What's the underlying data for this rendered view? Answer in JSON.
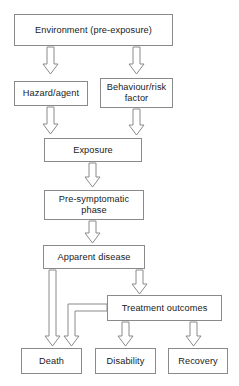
{
  "diagram": {
    "type": "flowchart",
    "style": {
      "box_border_color": "#8a8a8a",
      "box_fill_color": "#ffffff",
      "arrow_outline_color": "#8a8a8a",
      "arrow_fill_color": "#ffffff",
      "text_color": "#1a1a1a",
      "background_color": "#ffffff"
    },
    "nodes": [
      {
        "id": "environment",
        "label": "Environment (pre-exposure)",
        "x": 14,
        "y": 14,
        "w": 159,
        "h": 32
      },
      {
        "id": "hazard",
        "label": "Hazard/agent",
        "x": 14,
        "y": 81,
        "w": 74,
        "h": 25
      },
      {
        "id": "behaviour",
        "label": "Behaviour/risk factor",
        "line1": "Behaviour/risk",
        "line2": "factor",
        "x": 100,
        "y": 78,
        "w": 73,
        "h": 30
      },
      {
        "id": "exposure",
        "label": "Exposure",
        "x": 44,
        "y": 138,
        "w": 98,
        "h": 24
      },
      {
        "id": "presymptomatic",
        "label": "Pre-symptomatic phase",
        "line1": "Pre-symptomatic",
        "line2": "phase",
        "x": 44,
        "y": 190,
        "w": 100,
        "h": 30
      },
      {
        "id": "apparent",
        "label": "Apparent disease",
        "x": 43,
        "y": 245,
        "w": 102,
        "h": 24
      },
      {
        "id": "treatment",
        "label": "Treatment outcomes",
        "x": 107,
        "y": 295,
        "w": 115,
        "h": 26
      },
      {
        "id": "death",
        "label": "Death",
        "x": 21,
        "y": 348,
        "w": 61,
        "h": 26
      },
      {
        "id": "disability",
        "label": "Disability",
        "x": 95,
        "y": 348,
        "w": 61,
        "h": 26
      },
      {
        "id": "recovery",
        "label": "Recovery",
        "x": 168,
        "y": 348,
        "w": 60,
        "h": 26
      }
    ],
    "edges": [
      {
        "from": "environment",
        "to": "hazard",
        "kind": "straight-down"
      },
      {
        "from": "environment",
        "to": "behaviour",
        "kind": "straight-down"
      },
      {
        "from": "hazard",
        "to": "exposure",
        "kind": "straight-down"
      },
      {
        "from": "behaviour",
        "to": "exposure",
        "kind": "straight-down"
      },
      {
        "from": "exposure",
        "to": "presymptomatic",
        "kind": "straight-down"
      },
      {
        "from": "presymptomatic",
        "to": "apparent",
        "kind": "straight-down"
      },
      {
        "from": "apparent",
        "to": "death",
        "kind": "straight-down"
      },
      {
        "from": "apparent",
        "to": "treatment",
        "kind": "straight-down"
      },
      {
        "from": "treatment",
        "to": "death",
        "kind": "elbow-left-down"
      },
      {
        "from": "treatment",
        "to": "disability",
        "kind": "straight-down"
      },
      {
        "from": "treatment",
        "to": "recovery",
        "kind": "straight-down"
      }
    ]
  }
}
